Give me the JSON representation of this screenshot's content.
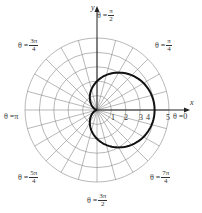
{
  "chart_data": {
    "type": "line",
    "subtype": "polar",
    "title": "",
    "equation_implied": "r = 2 + 2cos(theta)",
    "xlabel": "x",
    "ylabel": "y",
    "r_ticks": [
      "1",
      "2",
      "3",
      "4",
      "5"
    ],
    "r_max": 5,
    "grid": true,
    "radial_grid_step_deg": 15,
    "angle_labels": [
      {
        "id": "zero",
        "prefix": "θ = ",
        "num": "0",
        "den": ""
      },
      {
        "id": "pi4",
        "prefix": "θ = ",
        "num": "π",
        "den": "4"
      },
      {
        "id": "pi2",
        "prefix": "θ = ",
        "num": "π",
        "den": "2"
      },
      {
        "id": "3pi4",
        "prefix": "θ = ",
        "num": "3π",
        "den": "4"
      },
      {
        "id": "pi",
        "prefix": "θ = ",
        "num": "π",
        "den": ""
      },
      {
        "id": "5pi4",
        "prefix": "θ = ",
        "num": "5π",
        "den": "4"
      },
      {
        "id": "3pi2",
        "prefix": "θ = ",
        "num": "3π",
        "den": "2"
      },
      {
        "id": "7pi4",
        "prefix": "θ = ",
        "num": "7π",
        "den": "4"
      }
    ],
    "series": [
      {
        "name": "cardioid",
        "theta_deg": [
          0,
          30,
          60,
          90,
          120,
          150,
          180,
          210,
          240,
          270,
          300,
          330,
          360
        ],
        "r": [
          4,
          3.73,
          3,
          2,
          1,
          0.27,
          0,
          0.27,
          1,
          2,
          3,
          3.73,
          4
        ]
      }
    ],
    "colors": {
      "curve": "#111111",
      "grid": "#888888",
      "axis": "#222222"
    }
  },
  "labels": {
    "x_axis": "x",
    "y_axis": "y",
    "tick1": "1",
    "tick2": "2",
    "tick3": "3",
    "tick4": "4",
    "tick5": "5",
    "theta_prefix": "θ = ",
    "a0": "0",
    "api": "π",
    "api4_num": "π",
    "api4_den": "4",
    "api2_num": "π",
    "api2_den": "2",
    "a3pi4_num": "3π",
    "a3pi4_den": "4",
    "a5pi4_num": "5π",
    "a5pi4_den": "4",
    "a3pi2_num": "3π",
    "a3pi2_den": "2",
    "a7pi4_num": "7π",
    "a7pi4_den": "4"
  }
}
